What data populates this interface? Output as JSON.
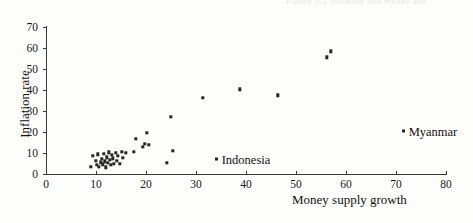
{
  "figure": {
    "cut_off_caption": "Figure 5.2  Inflation and money growth",
    "background_color": "#fdfdfb",
    "marker_color": "#262626",
    "axis_color": "#3b3b3b"
  },
  "chart_data": {
    "type": "scatter",
    "title": "",
    "xlabel": "Money supply growth",
    "ylabel": "Inflation rate",
    "xlim": [
      0,
      80
    ],
    "ylim": [
      0,
      70
    ],
    "xticks": [
      0,
      10,
      20,
      30,
      40,
      50,
      60,
      70,
      80
    ],
    "yticks": [
      0,
      10,
      20,
      30,
      40,
      50,
      60,
      70
    ],
    "xtick_labels": [
      "0",
      "10",
      "20",
      "30",
      "40",
      "50",
      "60",
      "70",
      "80"
    ],
    "ytick_labels": [
      "0",
      "10",
      "20",
      "30",
      "40",
      "50",
      "60",
      "70"
    ],
    "grid": false,
    "legend": null,
    "series": [
      {
        "name": "countries",
        "points": [
          [
            9.0,
            3.4
          ],
          [
            9.3,
            8.8
          ],
          [
            10.0,
            6.2
          ],
          [
            10.2,
            4.4
          ],
          [
            10.4,
            9.3
          ],
          [
            10.6,
            3.3
          ],
          [
            10.9,
            5.6
          ],
          [
            11.1,
            7.2
          ],
          [
            11.3,
            4.6
          ],
          [
            11.6,
            9.6
          ],
          [
            11.8,
            6.0
          ],
          [
            12.0,
            3.2
          ],
          [
            12.2,
            8.0
          ],
          [
            12.4,
            5.2
          ],
          [
            12.6,
            10.4
          ],
          [
            12.8,
            6.8
          ],
          [
            13.0,
            4.4
          ],
          [
            13.2,
            9.0
          ],
          [
            13.4,
            7.4
          ],
          [
            13.6,
            5.0
          ],
          [
            13.9,
            10.0
          ],
          [
            14.2,
            6.4
          ],
          [
            14.4,
            8.6
          ],
          [
            14.8,
            4.8
          ],
          [
            15.2,
            10.6
          ],
          [
            15.4,
            7.8
          ],
          [
            15.9,
            10.2
          ],
          [
            17.6,
            10.5
          ],
          [
            18.0,
            16.9
          ],
          [
            19.4,
            13.0
          ],
          [
            19.8,
            14.4
          ],
          [
            20.2,
            19.6
          ],
          [
            20.5,
            13.9
          ],
          [
            24.1,
            5.2
          ],
          [
            25.0,
            27.2
          ],
          [
            25.3,
            11.0
          ],
          [
            31.4,
            36.3
          ],
          [
            38.7,
            40.3
          ],
          [
            46.3,
            37.5
          ],
          [
            56.2,
            55.6
          ],
          [
            56.9,
            58.5
          ]
        ]
      }
    ],
    "annotations": [
      {
        "label": "Indonesia",
        "x": 34.5,
        "y": 6.9
      },
      {
        "label": "Myanmar",
        "x": 71.9,
        "y": 20.2
      }
    ]
  }
}
